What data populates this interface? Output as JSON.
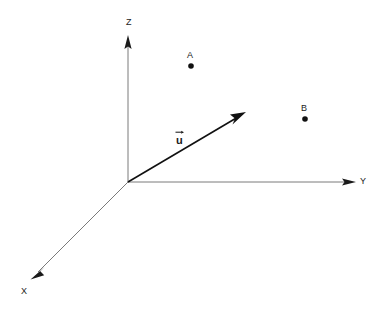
{
  "figure": {
    "type": "3d-coordinate-diagram",
    "background_color": "#ffffff",
    "width": 384,
    "height": 311
  },
  "axes": {
    "origin": {
      "x": 128,
      "y": 182
    },
    "color": "#7a7a7a",
    "stroke_width": 1,
    "items": [
      {
        "name": "z-axis",
        "label": "Z",
        "label_x": 126,
        "label_y": 18,
        "from": {
          "x": 128,
          "y": 182
        },
        "to": {
          "x": 128,
          "y": 36
        },
        "arrow": true
      },
      {
        "name": "y-axis",
        "label": "Y",
        "label_x": 360,
        "label_y": 177,
        "from": {
          "x": 128,
          "y": 182
        },
        "to": {
          "x": 356,
          "y": 182
        },
        "arrow": true
      },
      {
        "name": "x-axis",
        "label": "X",
        "label_x": 21,
        "label_y": 287,
        "from": {
          "x": 128,
          "y": 182
        },
        "to": {
          "x": 31,
          "y": 279
        },
        "arrow": true
      }
    ]
  },
  "vector": {
    "name": "u",
    "label": "u",
    "label_x": 176,
    "label_y": 135,
    "color": "#111111",
    "stroke_width": 1.6,
    "from": {
      "x": 128,
      "y": 182
    },
    "to": {
      "x": 245,
      "y": 113
    },
    "arrow": true
  },
  "points": [
    {
      "name": "point-a",
      "label": "A",
      "label_x": 187,
      "label_y": 51,
      "dot_x": 191,
      "dot_y": 66,
      "dot_radius": 2.8,
      "color": "#111111"
    },
    {
      "name": "point-b",
      "label": "B",
      "label_x": 301,
      "label_y": 104,
      "dot_x": 305,
      "dot_y": 119,
      "dot_radius": 2.8,
      "color": "#111111"
    }
  ]
}
